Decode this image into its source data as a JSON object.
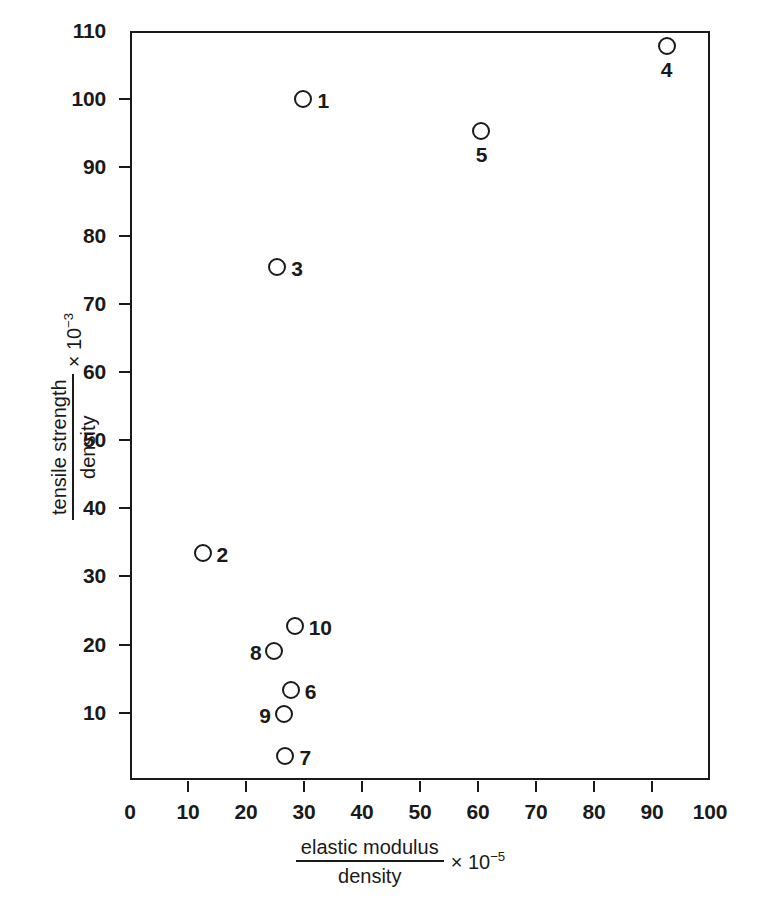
{
  "chart_data": {
    "type": "scatter",
    "title": "",
    "xlabel_numerator": "elastic modulus",
    "xlabel_denominator": "density",
    "xlabel_multiplier": "× 10",
    "xlabel_exponent": "−5",
    "ylabel_numerator": "tensile strength",
    "ylabel_denominator": "density",
    "ylabel_multiplier": "× 10",
    "ylabel_exponent": "−3",
    "xlim": [
      0,
      100
    ],
    "ylim": [
      0,
      110
    ],
    "xticks": [
      0,
      10,
      20,
      30,
      40,
      50,
      60,
      70,
      80,
      90,
      100
    ],
    "yticks": [
      10,
      20,
      30,
      40,
      50,
      60,
      70,
      80,
      90,
      100,
      110
    ],
    "xtick_labels": [
      "0",
      "10",
      "20",
      "30",
      "40",
      "50",
      "60",
      "70",
      "80",
      "90",
      "100"
    ],
    "ytick_labels": [
      "10",
      "20",
      "30",
      "40",
      "50",
      "60",
      "70",
      "80",
      "90",
      "100",
      "110"
    ],
    "grid": false,
    "legend": "none",
    "marker_style": "open-circle",
    "points": [
      {
        "label": "1",
        "x": 29.9,
        "y": 100.0,
        "label_pos": "right"
      },
      {
        "label": "2",
        "x": 12.5,
        "y": 33.4,
        "label_pos": "right"
      },
      {
        "label": "3",
        "x": 25.4,
        "y": 75.4,
        "label_pos": "right"
      },
      {
        "label": "4",
        "x": 92.5,
        "y": 107.8,
        "label_pos": "below"
      },
      {
        "label": "5",
        "x": 60.6,
        "y": 95.3,
        "label_pos": "below"
      },
      {
        "label": "6",
        "x": 27.7,
        "y": 13.3,
        "label_pos": "right"
      },
      {
        "label": "7",
        "x": 26.8,
        "y": 3.6,
        "label_pos": "right"
      },
      {
        "label": "8",
        "x": 24.9,
        "y": 19.1,
        "label_pos": "left"
      },
      {
        "label": "9",
        "x": 26.5,
        "y": 9.8,
        "label_pos": "left"
      },
      {
        "label": "10",
        "x": 28.4,
        "y": 22.8,
        "label_pos": "right"
      }
    ]
  },
  "colors": {
    "ink": "#1a1a1a",
    "background": "#ffffff"
  }
}
